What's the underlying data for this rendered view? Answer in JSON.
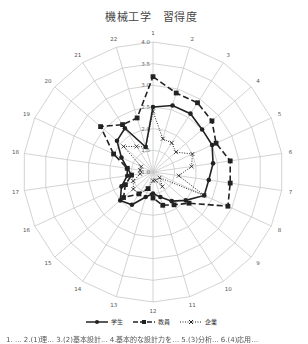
{
  "title": "機械工学　習得度",
  "footer_text": "1. ... 2.(1)理... 3.(2)基本設計... 4.基本的な設計力を... 5.(3)分析... 6.(4)応用...",
  "chart_data": {
    "type": "radar",
    "title": "機械工学　習得度",
    "axes": [
      "1",
      "2",
      "3",
      "4",
      "5",
      "6",
      "7",
      "8",
      "9",
      "10",
      "11",
      "12",
      "13",
      "14",
      "15",
      "16",
      "17",
      "18",
      "19",
      "20",
      "21",
      "22"
    ],
    "range": [
      1.0,
      4.0
    ],
    "ticks": [
      1.0,
      1.5,
      2.0,
      2.5,
      3.0,
      3.5,
      4.0
    ],
    "tick_labels": [
      "1.0",
      "1.5",
      "2.0",
      "2.5",
      "3.0",
      "3.5",
      "4.0"
    ],
    "grid": true,
    "legend_position": "bottom",
    "series": [
      {
        "name": "学生",
        "style": "solid",
        "marker": "circle",
        "values": [
          2.5,
          2.6,
          2.6,
          2.5,
          2.5,
          2.4,
          2.3,
          2.3,
          2.0,
          1.8,
          1.6,
          1.5,
          1.6,
          1.9,
          2.0,
          1.8,
          1.6,
          1.6,
          1.8,
          2.1,
          2.2,
          1.6
        ]
      },
      {
        "name": "教員",
        "style": "dashed",
        "marker": "square",
        "values": [
          3.2,
          2.9,
          2.9,
          2.8,
          2.6,
          2.8,
          2.8,
          2.9,
          2.1,
          1.9,
          1.8,
          1.6,
          1.4,
          1.6,
          1.9,
          1.7,
          1.5,
          1.6,
          2.0,
          2.6,
          2.3,
          2.3
        ]
      },
      {
        "name": "企業",
        "style": "dotted",
        "marker": "x",
        "values": [
          2.4,
          1.8,
          1.8,
          1.7,
          2.0,
          1.9,
          1.6,
          2.3,
          1.2,
          1.4,
          1.2,
          1.2,
          1.4,
          1.6,
          1.6,
          1.5,
          1.3,
          1.3,
          1.3,
          1.9,
          1.7,
          1.6
        ]
      }
    ]
  },
  "legend": [
    {
      "label": "学生"
    },
    {
      "label": "教員"
    },
    {
      "label": "企業"
    }
  ],
  "colors": {
    "grid": "#c8c8c8",
    "series": "#222222",
    "text": "#555555"
  }
}
